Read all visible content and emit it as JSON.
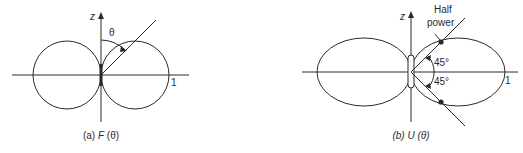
{
  "figures": [
    {
      "id": "a",
      "axis_label": "z",
      "angle_label": "θ",
      "scale_label": "1",
      "caption_prefix": "(a)",
      "caption_func": "F",
      "caption_arg": "(θ)",
      "pattern": "figure-eight circles (field pattern)"
    },
    {
      "id": "b",
      "axis_label": "z",
      "annotation_line1": "Half",
      "annotation_line2": "power",
      "angle_upper": "45°",
      "angle_lower": "45°",
      "scale_label": "1",
      "caption_prefix": "(b)",
      "caption_func": "U",
      "caption_arg": "(θ)",
      "pattern": "elongated lobes (power pattern)"
    }
  ],
  "colors": {
    "ink": "#2a2a2a",
    "background": "#ffffff"
  }
}
